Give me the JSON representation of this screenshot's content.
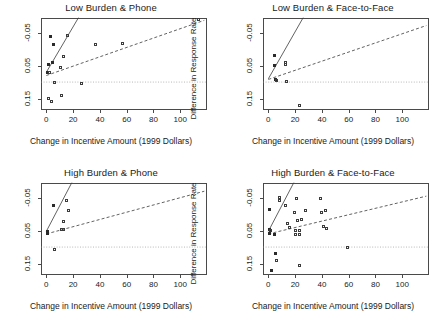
{
  "figure": {
    "axis_labels": {
      "x": "Change in Incentive Amount (1999 Dollars)",
      "y": "Difference in Response Rate"
    },
    "x_ticks": [
      "0",
      "20",
      "40",
      "60",
      "80",
      "100"
    ],
    "y_ticks": [
      "0.15",
      "0.05",
      "-0.05"
    ]
  },
  "chart_data": [
    {
      "type": "scatter",
      "title": "Low Burden & Phone",
      "xlabel": "Change in Incentive Amount (1999 Dollars)",
      "ylabel": "Difference in Response Rate",
      "xlim": [
        -4,
        120
      ],
      "ylim": [
        -0.085,
        0.195
      ],
      "xticks": [
        0,
        20,
        40,
        60,
        80,
        100
      ],
      "yticks": [
        -0.05,
        0.05,
        0.15
      ],
      "grid": false,
      "legend": "none",
      "points": [
        {
          "x": 1.0,
          "y": 0.03,
          "filled": true
        },
        {
          "x": 1.5,
          "y": 0.055,
          "filled": true
        },
        {
          "x": 2.0,
          "y": 0.03,
          "filled": false
        },
        {
          "x": 1.5,
          "y": -0.05,
          "filled": false
        },
        {
          "x": 3.0,
          "y": 0.14,
          "filled": true
        },
        {
          "x": 4.5,
          "y": 0.06,
          "filled": true
        },
        {
          "x": 5.0,
          "y": 0.115,
          "filled": true
        },
        {
          "x": 4.0,
          "y": -0.058,
          "filled": false
        },
        {
          "x": 6.0,
          "y": -0.002,
          "filled": false
        },
        {
          "x": 10.5,
          "y": 0.043,
          "filled": false
        },
        {
          "x": 11.0,
          "y": -0.04,
          "filled": false
        },
        {
          "x": 13.0,
          "y": 0.078,
          "filled": false
        },
        {
          "x": 16.0,
          "y": 0.143,
          "filled": false
        },
        {
          "x": 26.0,
          "y": -0.005,
          "filled": false
        },
        {
          "x": 37.0,
          "y": 0.115,
          "filled": false
        },
        {
          "x": 57.0,
          "y": 0.118,
          "filled": false
        },
        {
          "x": 114.0,
          "y": 0.19,
          "filled": false
        }
      ],
      "lines": [
        {
          "name": "solid-fit",
          "style": "solid",
          "x0": 0,
          "y0": 0.03,
          "x1": 24,
          "y1": 0.196
        },
        {
          "name": "dashed-fit",
          "style": "dashed",
          "x0": 0,
          "y0": 0.02,
          "x1": 118,
          "y1": 0.188
        },
        {
          "name": "zero-reference",
          "style": "dotted",
          "x0": -4,
          "y0": 0.0,
          "x1": 120,
          "y1": 0.0
        }
      ]
    },
    {
      "type": "scatter",
      "title": "Low Burden & Face-to-Face",
      "xlabel": "Change in Incentive Amount (1999 Dollars)",
      "ylabel": "Difference in Response Rate",
      "xlim": [
        -4,
        120
      ],
      "ylim": [
        -0.085,
        0.195
      ],
      "xticks": [
        0,
        20,
        40,
        60,
        80,
        100
      ],
      "yticks": [
        -0.05,
        0.05,
        0.15
      ],
      "grid": false,
      "legend": "none",
      "points": [
        {
          "x": 4.5,
          "y": 0.08,
          "filled": true
        },
        {
          "x": 4.5,
          "y": 0.05,
          "filled": true
        },
        {
          "x": 5.0,
          "y": 0.008,
          "filled": true
        },
        {
          "x": 6.0,
          "y": 0.006,
          "filled": false
        },
        {
          "x": 12.5,
          "y": 0.06,
          "filled": false
        },
        {
          "x": 12.5,
          "y": 0.052,
          "filled": false
        },
        {
          "x": 13.5,
          "y": 0.002,
          "filled": false
        },
        {
          "x": 23.0,
          "y": -0.072,
          "filled": false
        }
      ],
      "lines": [
        {
          "name": "solid-fit",
          "style": "solid",
          "x0": 0,
          "y0": 0.01,
          "x1": 26,
          "y1": 0.196
        },
        {
          "name": "dashed-fit",
          "style": "dashed",
          "x0": 0,
          "y0": 0.008,
          "x1": 118,
          "y1": 0.172
        },
        {
          "name": "zero-reference",
          "style": "dotted",
          "x0": -4,
          "y0": 0.0,
          "x1": 120,
          "y1": 0.0
        }
      ]
    },
    {
      "type": "scatter",
      "title": "High Burden & Phone",
      "xlabel": "Change in Incentive Amount (1999 Dollars)",
      "ylabel": "Difference in Response Rate",
      "xlim": [
        -4,
        120
      ],
      "ylim": [
        -0.085,
        0.195
      ],
      "xticks": [
        0,
        20,
        40,
        60,
        80,
        100
      ],
      "yticks": [
        -0.05,
        0.05,
        0.15
      ],
      "grid": false,
      "legend": "none",
      "points": [
        {
          "x": 1.0,
          "y": 0.048,
          "filled": true
        },
        {
          "x": 1.2,
          "y": 0.042,
          "filled": true
        },
        {
          "x": 5.0,
          "y": 0.128,
          "filled": true
        },
        {
          "x": 6.0,
          "y": -0.008,
          "filled": false
        },
        {
          "x": 11.0,
          "y": 0.053,
          "filled": false
        },
        {
          "x": 12.5,
          "y": 0.052,
          "filled": false
        },
        {
          "x": 13.0,
          "y": 0.078,
          "filled": false
        },
        {
          "x": 15.0,
          "y": 0.142,
          "filled": false
        },
        {
          "x": 16.5,
          "y": 0.11,
          "filled": false
        }
      ],
      "lines": [
        {
          "name": "solid-fit",
          "style": "solid",
          "x0": 0,
          "y0": 0.048,
          "x1": 19,
          "y1": 0.196
        },
        {
          "name": "dashed-fit",
          "style": "dashed",
          "x0": 0,
          "y0": 0.04,
          "x1": 118,
          "y1": 0.17
        },
        {
          "name": "zero-reference",
          "style": "dotted",
          "x0": -4,
          "y0": 0.0,
          "x1": 120,
          "y1": 0.0
        }
      ]
    },
    {
      "type": "scatter",
      "title": "High Burden & Face-to-Face",
      "xlabel": "Change in Incentive Amount (1999 Dollars)",
      "ylabel": "Difference in Response Rate",
      "xlim": [
        -4,
        120
      ],
      "ylim": [
        -0.085,
        0.195
      ],
      "xticks": [
        0,
        20,
        40,
        60,
        80,
        100
      ],
      "yticks": [
        -0.05,
        0.05,
        0.15
      ],
      "grid": false,
      "legend": "none",
      "points": [
        {
          "x": 0.8,
          "y": 0.115,
          "filled": true
        },
        {
          "x": 1.0,
          "y": 0.055,
          "filled": true
        },
        {
          "x": 1.2,
          "y": 0.042,
          "filled": true
        },
        {
          "x": 1.5,
          "y": 0.05,
          "filled": false
        },
        {
          "x": 2.0,
          "y": -0.07,
          "filled": true
        },
        {
          "x": 4.5,
          "y": 0.038,
          "filled": true
        },
        {
          "x": 5.0,
          "y": -0.02,
          "filled": true
        },
        {
          "x": 6.0,
          "y": -0.04,
          "filled": false
        },
        {
          "x": 8.0,
          "y": 0.15,
          "filled": false
        },
        {
          "x": 8.0,
          "y": 0.143,
          "filled": false
        },
        {
          "x": 13.0,
          "y": 0.128,
          "filled": false
        },
        {
          "x": 14.0,
          "y": 0.072,
          "filled": false
        },
        {
          "x": 16.0,
          "y": 0.06,
          "filled": false
        },
        {
          "x": 19.5,
          "y": 0.105,
          "filled": false
        },
        {
          "x": 20.0,
          "y": 0.05,
          "filled": false
        },
        {
          "x": 20.5,
          "y": 0.038,
          "filled": false
        },
        {
          "x": 21.0,
          "y": 0.148,
          "filled": false
        },
        {
          "x": 22.0,
          "y": 0.08,
          "filled": false
        },
        {
          "x": 23.0,
          "y": 0.05,
          "filled": false
        },
        {
          "x": 23.5,
          "y": 0.038,
          "filled": false
        },
        {
          "x": 23.5,
          "y": -0.055,
          "filled": false
        },
        {
          "x": 24.5,
          "y": 0.085,
          "filled": false
        },
        {
          "x": 28.0,
          "y": 0.112,
          "filled": false
        },
        {
          "x": 39.0,
          "y": 0.148,
          "filled": false
        },
        {
          "x": 39.5,
          "y": 0.105,
          "filled": false
        },
        {
          "x": 41.5,
          "y": 0.062,
          "filled": false
        },
        {
          "x": 43.0,
          "y": 0.112,
          "filled": false
        },
        {
          "x": 43.5,
          "y": 0.058,
          "filled": false
        },
        {
          "x": 59.0,
          "y": 0.0,
          "filled": false
        }
      ],
      "lines": [
        {
          "name": "solid-fit",
          "style": "solid",
          "x0": 0,
          "y0": 0.048,
          "x1": 19,
          "y1": 0.196
        },
        {
          "name": "dashed-fit",
          "style": "dashed",
          "x0": 0,
          "y0": 0.04,
          "x1": 118,
          "y1": 0.155
        },
        {
          "name": "zero-reference",
          "style": "dotted",
          "x0": -4,
          "y0": 0.0,
          "x1": 120,
          "y1": 0.0
        }
      ]
    }
  ]
}
